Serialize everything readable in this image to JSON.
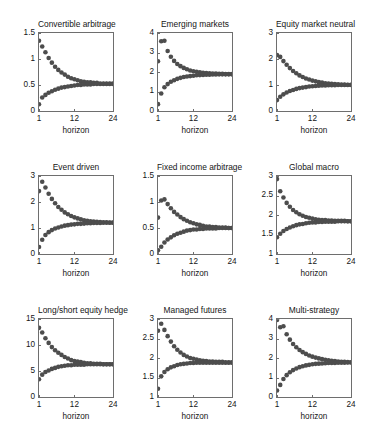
{
  "figure": {
    "width": 366,
    "height": 430,
    "background": "#ffffff",
    "marker_color": "#4d4d4d",
    "axis_color": "#6e6e6e",
    "rows": 3,
    "cols": 3
  },
  "chart_data": [
    {
      "type": "scatter",
      "title": "Convertible arbitrage",
      "xlabel": "horizon",
      "ylabel": "",
      "xlim": [
        1,
        24
      ],
      "ylim": [
        0,
        1.5
      ],
      "xticks": [
        1,
        12,
        24
      ],
      "xticklabels": [
        "1",
        "12",
        "24"
      ],
      "yticks": [
        0,
        0.5,
        1,
        1.5
      ],
      "yticklabels": [
        "0",
        "0.5",
        "1",
        "1.5"
      ],
      "grid": false,
      "legend": "none",
      "x": [
        1,
        2,
        3,
        4,
        5,
        6,
        7,
        8,
        9,
        10,
        11,
        12,
        13,
        14,
        15,
        16,
        17,
        18,
        19,
        20,
        21,
        22,
        23,
        24
      ],
      "series": [
        {
          "name": "upper band",
          "values": [
            1.35,
            1.24,
            1.13,
            1.02,
            0.93,
            0.85,
            0.79,
            0.74,
            0.7,
            0.66,
            0.63,
            0.61,
            0.59,
            0.57,
            0.56,
            0.55,
            0.55,
            0.54,
            0.54,
            0.53,
            0.53,
            0.53,
            0.53,
            0.53
          ]
        },
        {
          "name": "lower band",
          "values": [
            0.13,
            0.26,
            0.31,
            0.35,
            0.38,
            0.41,
            0.43,
            0.45,
            0.46,
            0.47,
            0.48,
            0.49,
            0.5,
            0.5,
            0.51,
            0.51,
            0.51,
            0.52,
            0.52,
            0.52,
            0.52,
            0.52,
            0.52,
            0.52
          ]
        }
      ]
    },
    {
      "type": "scatter",
      "title": "Emerging markets",
      "xlabel": "horizon",
      "ylabel": "",
      "xlim": [
        1,
        24
      ],
      "ylim": [
        0,
        4
      ],
      "xticks": [
        1,
        12,
        24
      ],
      "xticklabels": [
        "1",
        "12",
        "24"
      ],
      "yticks": [
        0,
        1,
        2,
        3,
        4
      ],
      "yticklabels": [
        "0",
        "1",
        "2",
        "3",
        "4"
      ],
      "grid": false,
      "legend": "none",
      "x": [
        1,
        2,
        3,
        4,
        5,
        6,
        7,
        8,
        9,
        10,
        11,
        12,
        13,
        14,
        15,
        16,
        17,
        18,
        19,
        20,
        21,
        22,
        23,
        24
      ],
      "series": [
        {
          "name": "upper band",
          "values": [
            2.55,
            3.58,
            3.6,
            3.08,
            2.78,
            2.57,
            2.41,
            2.3,
            2.21,
            2.14,
            2.08,
            2.04,
            2.01,
            1.98,
            1.96,
            1.95,
            1.93,
            1.92,
            1.92,
            1.91,
            1.91,
            1.9,
            1.9,
            1.9
          ]
        },
        {
          "name": "lower band",
          "values": [
            0.35,
            0.9,
            1.22,
            1.38,
            1.5,
            1.58,
            1.65,
            1.7,
            1.74,
            1.77,
            1.79,
            1.81,
            1.83,
            1.84,
            1.85,
            1.86,
            1.86,
            1.87,
            1.87,
            1.88,
            1.88,
            1.88,
            1.88,
            1.88
          ]
        }
      ]
    },
    {
      "type": "scatter",
      "title": "Equity market neutral",
      "xlabel": "horizon",
      "ylabel": "",
      "xlim": [
        1,
        24
      ],
      "ylim": [
        0,
        3
      ],
      "xticks": [
        1,
        12,
        24
      ],
      "xticklabels": [
        "1",
        "12",
        "24"
      ],
      "yticks": [
        0,
        1,
        2,
        3
      ],
      "yticklabels": [
        "0",
        "1",
        "2",
        "3"
      ],
      "grid": false,
      "legend": "none",
      "x": [
        1,
        2,
        3,
        4,
        5,
        6,
        7,
        8,
        9,
        10,
        11,
        12,
        13,
        14,
        15,
        16,
        17,
        18,
        19,
        20,
        21,
        22,
        23,
        24
      ],
      "series": [
        {
          "name": "upper band",
          "values": [
            2.15,
            2.08,
            1.92,
            1.78,
            1.65,
            1.54,
            1.45,
            1.37,
            1.31,
            1.25,
            1.21,
            1.17,
            1.14,
            1.11,
            1.09,
            1.07,
            1.06,
            1.05,
            1.04,
            1.03,
            1.02,
            1.02,
            1.01,
            1.01
          ]
        },
        {
          "name": "lower band",
          "values": [
            0.42,
            0.55,
            0.64,
            0.71,
            0.77,
            0.81,
            0.85,
            0.88,
            0.9,
            0.92,
            0.94,
            0.95,
            0.96,
            0.97,
            0.98,
            0.98,
            0.99,
            0.99,
            0.99,
            1.0,
            1.0,
            1.0,
            1.0,
            1.0
          ]
        }
      ]
    },
    {
      "type": "scatter",
      "title": "Event driven",
      "xlabel": "horizon",
      "ylabel": "",
      "xlim": [
        1,
        24
      ],
      "ylim": [
        0,
        3
      ],
      "xticks": [
        1,
        12,
        24
      ],
      "xticklabels": [
        "1",
        "12",
        "24"
      ],
      "yticks": [
        0,
        1,
        2,
        3
      ],
      "yticklabels": [
        "0",
        "1",
        "2",
        "3"
      ],
      "grid": false,
      "legend": "none",
      "x": [
        1,
        2,
        3,
        4,
        5,
        6,
        7,
        8,
        9,
        10,
        11,
        12,
        13,
        14,
        15,
        16,
        17,
        18,
        19,
        20,
        21,
        22,
        23,
        24
      ],
      "series": [
        {
          "name": "upper band",
          "values": [
            2.42,
            2.78,
            2.56,
            2.32,
            2.12,
            1.95,
            1.81,
            1.7,
            1.6,
            1.53,
            1.46,
            1.41,
            1.37,
            1.33,
            1.3,
            1.28,
            1.26,
            1.25,
            1.24,
            1.23,
            1.22,
            1.22,
            1.21,
            1.21
          ]
        },
        {
          "name": "lower band",
          "values": [
            0.27,
            0.55,
            0.73,
            0.84,
            0.92,
            0.98,
            1.02,
            1.06,
            1.09,
            1.11,
            1.13,
            1.14,
            1.16,
            1.16,
            1.17,
            1.18,
            1.18,
            1.19,
            1.19,
            1.19,
            1.2,
            1.2,
            1.2,
            1.2
          ]
        }
      ]
    },
    {
      "type": "scatter",
      "title": "Fixed income arbitrage",
      "xlabel": "horizon",
      "ylabel": "",
      "xlim": [
        1,
        24
      ],
      "ylim": [
        0,
        1.5
      ],
      "xticks": [
        1,
        12,
        24
      ],
      "xticklabels": [
        "1",
        "12",
        "24"
      ],
      "yticks": [
        0,
        0.5,
        1,
        1.5
      ],
      "yticklabels": [
        "0",
        "0.5",
        "1",
        "1.5"
      ],
      "grid": false,
      "legend": "none",
      "x": [
        1,
        2,
        3,
        4,
        5,
        6,
        7,
        8,
        9,
        10,
        11,
        12,
        13,
        14,
        15,
        16,
        17,
        18,
        19,
        20,
        21,
        22,
        23,
        24
      ],
      "series": [
        {
          "name": "upper band",
          "values": [
            0.7,
            1.03,
            1.05,
            0.96,
            0.88,
            0.81,
            0.76,
            0.71,
            0.67,
            0.64,
            0.61,
            0.59,
            0.57,
            0.56,
            0.54,
            0.53,
            0.53,
            0.52,
            0.52,
            0.51,
            0.51,
            0.51,
            0.5,
            0.5
          ]
        },
        {
          "name": "lower band",
          "values": [
            0.07,
            0.14,
            0.22,
            0.28,
            0.32,
            0.36,
            0.39,
            0.41,
            0.43,
            0.45,
            0.46,
            0.47,
            0.47,
            0.48,
            0.48,
            0.49,
            0.49,
            0.49,
            0.49,
            0.5,
            0.5,
            0.5,
            0.5,
            0.5
          ]
        }
      ]
    },
    {
      "type": "scatter",
      "title": "Global macro",
      "xlabel": "horizon",
      "ylabel": "",
      "xlim": [
        1,
        24
      ],
      "ylim": [
        1,
        3
      ],
      "xticks": [
        1,
        12,
        24
      ],
      "xticklabels": [
        "1",
        "12",
        "24"
      ],
      "yticks": [
        1,
        1.5,
        2,
        2.5,
        3
      ],
      "yticklabels": [
        "1",
        "1.5",
        "2",
        "2.5",
        "3"
      ],
      "grid": false,
      "legend": "none",
      "x": [
        1,
        2,
        3,
        4,
        5,
        6,
        7,
        8,
        9,
        10,
        11,
        12,
        13,
        14,
        15,
        16,
        17,
        18,
        19,
        20,
        21,
        22,
        23,
        24
      ],
      "series": [
        {
          "name": "upper band",
          "values": [
            2.92,
            2.61,
            2.45,
            2.31,
            2.21,
            2.13,
            2.07,
            2.02,
            1.98,
            1.95,
            1.93,
            1.91,
            1.89,
            1.88,
            1.87,
            1.87,
            1.86,
            1.86,
            1.85,
            1.85,
            1.85,
            1.85,
            1.84,
            1.84
          ]
        },
        {
          "name": "lower band",
          "values": [
            1.43,
            1.52,
            1.59,
            1.64,
            1.68,
            1.71,
            1.74,
            1.76,
            1.77,
            1.79,
            1.8,
            1.81,
            1.81,
            1.82,
            1.82,
            1.83,
            1.83,
            1.83,
            1.83,
            1.84,
            1.84,
            1.84,
            1.84,
            1.84
          ]
        }
      ]
    },
    {
      "type": "scatter",
      "title": "Long/short equity hedge",
      "xlabel": "horizon",
      "ylabel": "",
      "xlim": [
        1,
        24
      ],
      "ylim": [
        0,
        15
      ],
      "xticks": [
        1,
        12,
        24
      ],
      "xticklabels": [
        "1",
        "12",
        "24"
      ],
      "yticks": [
        0,
        5,
        10,
        15
      ],
      "yticklabels": [
        "0",
        "5",
        "10",
        "15"
      ],
      "grid": false,
      "legend": "none",
      "x": [
        1,
        2,
        3,
        4,
        5,
        6,
        7,
        8,
        9,
        10,
        11,
        12,
        13,
        14,
        15,
        16,
        17,
        18,
        19,
        20,
        21,
        22,
        23,
        24
      ],
      "series": [
        {
          "name": "upper band",
          "values": [
            13.3,
            12.4,
            11.3,
            10.4,
            9.6,
            9.0,
            8.5,
            8.1,
            7.7,
            7.4,
            7.1,
            6.9,
            6.8,
            6.7,
            6.6,
            6.5,
            6.5,
            6.4,
            6.4,
            6.4,
            6.3,
            6.3,
            6.3,
            6.3
          ]
        },
        {
          "name": "lower band",
          "values": [
            3.4,
            4.3,
            4.8,
            5.1,
            5.4,
            5.6,
            5.8,
            5.9,
            6.0,
            6.1,
            6.1,
            6.2,
            6.2,
            6.2,
            6.2,
            6.3,
            6.3,
            6.3,
            6.3,
            6.3,
            6.3,
            6.3,
            6.3,
            6.3
          ]
        }
      ]
    },
    {
      "type": "scatter",
      "title": "Managed futures",
      "xlabel": "horizon",
      "ylabel": "",
      "xlim": [
        1,
        24
      ],
      "ylim": [
        1,
        3
      ],
      "xticks": [
        1,
        12,
        24
      ],
      "xticklabels": [
        "1",
        "12",
        "24"
      ],
      "yticks": [
        1,
        1.5,
        2,
        2.5,
        3
      ],
      "yticklabels": [
        "1",
        "1.5",
        "2",
        "2.5",
        "3"
      ],
      "grid": false,
      "legend": "none",
      "x": [
        1,
        2,
        3,
        4,
        5,
        6,
        7,
        8,
        9,
        10,
        11,
        12,
        13,
        14,
        15,
        16,
        17,
        18,
        19,
        20,
        21,
        22,
        23,
        24
      ],
      "series": [
        {
          "name": "upper band",
          "values": [
            2.7,
            2.88,
            2.72,
            2.56,
            2.42,
            2.3,
            2.21,
            2.14,
            2.08,
            2.04,
            2.0,
            1.98,
            1.96,
            1.94,
            1.93,
            1.92,
            1.91,
            1.91,
            1.9,
            1.9,
            1.9,
            1.89,
            1.89,
            1.89
          ]
        },
        {
          "name": "lower band",
          "values": [
            1.21,
            1.53,
            1.64,
            1.71,
            1.76,
            1.79,
            1.82,
            1.84,
            1.85,
            1.86,
            1.87,
            1.87,
            1.88,
            1.88,
            1.88,
            1.88,
            1.88,
            1.88,
            1.88,
            1.88,
            1.88,
            1.88,
            1.88,
            1.88
          ]
        }
      ]
    },
    {
      "type": "scatter",
      "title": "Multi-strategy",
      "xlabel": "horizon",
      "ylabel": "",
      "xlim": [
        1,
        24
      ],
      "ylim": [
        0,
        4
      ],
      "xticks": [
        1,
        12,
        24
      ],
      "xticklabels": [
        "1",
        "12",
        "24"
      ],
      "yticks": [
        0,
        1,
        2,
        3,
        4
      ],
      "yticklabels": [
        "0",
        "1",
        "2",
        "3",
        "4"
      ],
      "grid": false,
      "legend": "none",
      "x": [
        1,
        2,
        3,
        4,
        5,
        6,
        7,
        8,
        9,
        10,
        11,
        12,
        13,
        14,
        15,
        16,
        17,
        18,
        19,
        20,
        21,
        22,
        23,
        24
      ],
      "series": [
        {
          "name": "upper band",
          "values": [
            3.95,
            3.58,
            3.63,
            3.22,
            2.94,
            2.72,
            2.55,
            2.41,
            2.3,
            2.21,
            2.13,
            2.07,
            2.02,
            1.98,
            1.94,
            1.91,
            1.88,
            1.86,
            1.84,
            1.82,
            1.81,
            1.8,
            1.79,
            1.78
          ]
        },
        {
          "name": "lower band",
          "values": [
            0.33,
            0.62,
            0.92,
            1.12,
            1.27,
            1.38,
            1.46,
            1.53,
            1.58,
            1.62,
            1.65,
            1.68,
            1.7,
            1.71,
            1.72,
            1.73,
            1.74,
            1.75,
            1.75,
            1.76,
            1.76,
            1.76,
            1.77,
            1.77
          ]
        }
      ]
    }
  ]
}
